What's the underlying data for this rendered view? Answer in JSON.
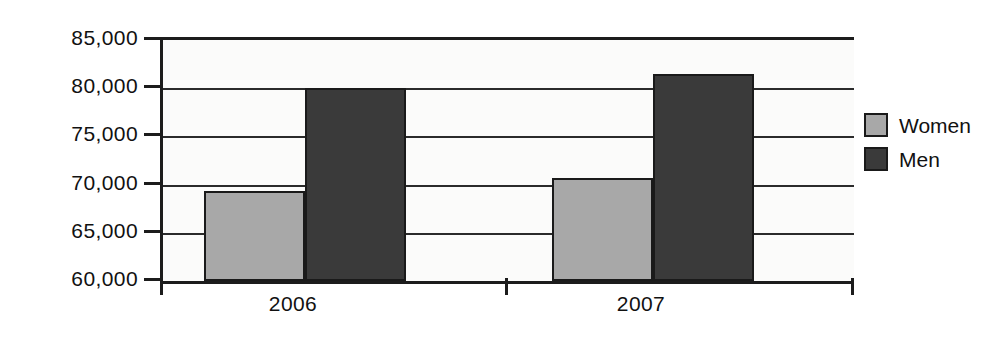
{
  "chart_data": {
    "type": "bar",
    "title": "",
    "subtitle": "",
    "xlabel": "",
    "ylabel": "",
    "categories": [
      "2006",
      "2007"
    ],
    "series": [
      {
        "name": "Women",
        "color": "#a8a8a8",
        "values": [
          69300,
          80000
        ]
      },
      {
        "name": "Men",
        "color": "#3a3a3a",
        "values": [
          70700,
          81500
        ]
      }
    ],
    "grouped_values": {
      "2006": {
        "Women": 69300,
        "Men": 80000
      },
      "2007": {
        "Women": 70700,
        "Men": 81500
      }
    },
    "ylim": [
      60000,
      85000
    ],
    "ytick_step": 5000,
    "ytick_labels": [
      "85,000",
      "80,000",
      "75,000",
      "70,000",
      "65,000",
      "60,000"
    ],
    "ytick_values": [
      85000,
      80000,
      75000,
      70000,
      65000,
      60000
    ],
    "grid": true,
    "grid_axis": "y",
    "legend_position": "right",
    "legend_entries": [
      "Women",
      "Men"
    ],
    "bar_style": "grouped-adjacent",
    "background": "#fbfbfa",
    "axis_color": "#1c1c1c"
  },
  "axis": {
    "y_labels": [
      "85,000",
      "80,000",
      "75,000",
      "70,000",
      "65,000",
      "60,000"
    ],
    "x_labels": [
      "2006",
      "2007"
    ]
  },
  "legend": {
    "items": [
      {
        "label": "Women",
        "color": "#a8a8a8"
      },
      {
        "label": "Men",
        "color": "#3a3a3a"
      }
    ]
  }
}
